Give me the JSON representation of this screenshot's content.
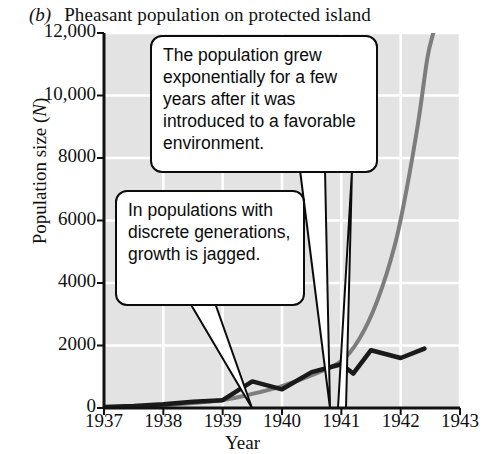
{
  "figure": {
    "panel_letter": "(b)",
    "title": "Pheasant population on protected island",
    "background": "#e3e3e3",
    "gridline_color": "#ffffff",
    "axis_color": "#111111"
  },
  "axes": {
    "ylabel_main": "Population size (",
    "ylabel_symbol": "N",
    "ylabel_close": ")",
    "xlabel": "Year",
    "yticks": [
      "12,000",
      "10,000",
      "8000",
      "6000",
      "4000",
      "2000",
      "0"
    ],
    "ytick_values": [
      12000,
      10000,
      8000,
      6000,
      4000,
      2000,
      0
    ],
    "xticks": [
      "1937",
      "1938",
      "1939",
      "1940",
      "1941",
      "1942",
      "1943"
    ],
    "xtick_values": [
      1937,
      1938,
      1939,
      1940,
      1941,
      1942,
      1943
    ]
  },
  "callouts": [
    {
      "name": "callout-growth",
      "text": "The population grew exponentially for a few years after it was introduced to a favorable environment."
    },
    {
      "name": "callout-jagged",
      "text": "In populations with discrete generations, growth is jagged."
    }
  ],
  "chart_data": {
    "type": "line",
    "title": "(b) Pheasant population on protected island",
    "xlabel": "Year",
    "ylabel": "Population size (N)",
    "xlim": [
      1937,
      1943
    ],
    "ylim": [
      0,
      12000
    ],
    "grid": true,
    "legend": "none",
    "series": [
      {
        "name": "Observed population (discrete generations, jagged)",
        "color": "#1a1a1a",
        "style": "jagged-line",
        "points": [
          [
            1937.0,
            30
          ],
          [
            1937.5,
            60
          ],
          [
            1938.0,
            120
          ],
          [
            1938.5,
            200
          ],
          [
            1939.0,
            250
          ],
          [
            1939.5,
            850
          ],
          [
            1940.0,
            600
          ],
          [
            1940.5,
            1150
          ],
          [
            1941.0,
            1400
          ],
          [
            1941.2,
            1100
          ],
          [
            1941.5,
            1850
          ],
          [
            1942.0,
            1600
          ],
          [
            1942.4,
            1900
          ]
        ]
      },
      {
        "name": "Exponential growth model (smooth)",
        "color": "#7d7d7d",
        "style": "smooth-curve",
        "points": [
          [
            1937.0,
            20
          ],
          [
            1938.0,
            90
          ],
          [
            1939.0,
            260
          ],
          [
            1939.5,
            450
          ],
          [
            1940.0,
            700
          ],
          [
            1940.5,
            1050
          ],
          [
            1941.0,
            1500
          ],
          [
            1941.3,
            2200
          ],
          [
            1941.6,
            3400
          ],
          [
            1941.9,
            5200
          ],
          [
            1942.1,
            7000
          ],
          [
            1942.3,
            9200
          ],
          [
            1942.45,
            11200
          ],
          [
            1942.55,
            12000
          ]
        ]
      }
    ],
    "annotations": [
      "The population grew exponentially for a few years after it was introduced to a favorable environment.",
      "In populations with discrete generations, growth is jagged."
    ]
  }
}
